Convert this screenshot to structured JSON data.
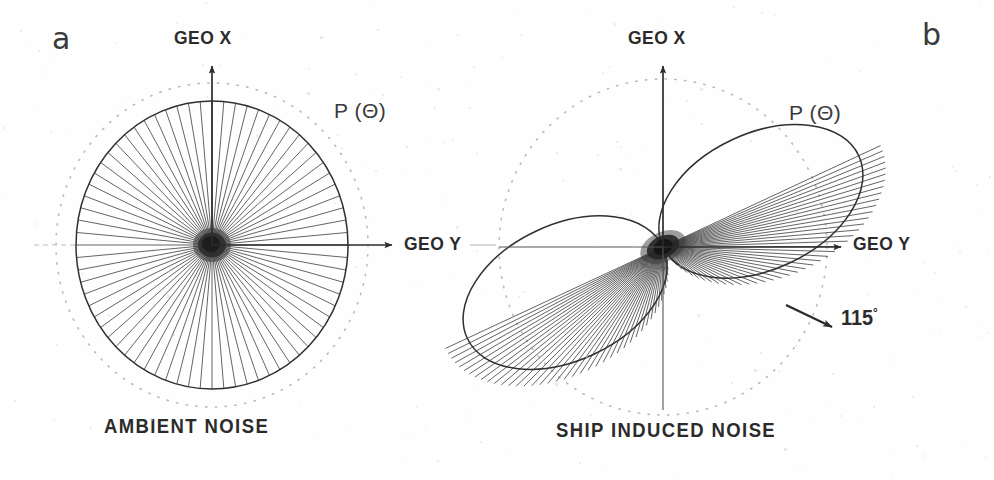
{
  "figure": {
    "background_color": "#fefefe",
    "ink_color": "#2b2b2b",
    "width": 994,
    "height": 480
  },
  "panels": [
    {
      "letter": "a",
      "caption": "AMBIENT NOISE",
      "curve_label": "P (Θ)",
      "axis_x_label": "GEO X",
      "axis_y_label": "GEO Y",
      "center": [
        212,
        245
      ],
      "letter_pos": [
        52,
        24
      ],
      "caption_pos": [
        104,
        415
      ],
      "curve_label_pos": [
        334,
        100
      ],
      "axis_x_label_pos": [
        174,
        28
      ],
      "axis_y_label_pos": [
        404,
        234
      ]
    },
    {
      "letter": "b",
      "caption": "SHIP INDUCED NOISE",
      "curve_label": "P (Θ)",
      "axis_x_label": "GEO X",
      "axis_y_label": "GEO Y",
      "angle_label": "115",
      "angle_unit": "°",
      "angle_label_pos": [
        841,
        318
      ],
      "center": [
        663,
        247
      ],
      "letter_pos": [
        922,
        20
      ],
      "caption_pos": [
        556,
        419
      ],
      "curve_label_pos": [
        789,
        102
      ],
      "axis_x_label_pos": [
        628,
        28
      ],
      "axis_y_label_pos": [
        853,
        234
      ]
    }
  ],
  "chart_data": {
    "type": "line",
    "subtitle": "Beam response P(Θ) in geographic coordinates",
    "plots": [
      {
        "name": "AMBIENT NOISE",
        "panel": "a",
        "pattern": "omnidirectional",
        "angular_label": "P (Θ)",
        "axes": [
          "GEO X",
          "GEO Y"
        ],
        "radius_major_px": 144,
        "radius_minor_px": 136,
        "spoke_count": 72,
        "reference_circle_radius_px": 158,
        "reference_circle_style": "dotted",
        "theta_deg": [
          0,
          15,
          30,
          45,
          60,
          75,
          90,
          105,
          120,
          135,
          150,
          165,
          180,
          195,
          210,
          225,
          240,
          255,
          270,
          285,
          300,
          315,
          330,
          345
        ],
        "radius_normalized": [
          1.0,
          0.99,
          0.98,
          0.97,
          0.96,
          0.95,
          0.95,
          0.95,
          0.96,
          0.97,
          0.98,
          0.99,
          1.0,
          0.99,
          0.98,
          0.97,
          0.96,
          0.95,
          0.95,
          0.95,
          0.96,
          0.97,
          0.98,
          0.99
        ],
        "notes": "Nearly isotropic response; slight elongation along GEO X"
      },
      {
        "name": "SHIP INDUCED NOISE",
        "panel": "b",
        "pattern": "dipole",
        "angular_label": "P (Θ)",
        "axes": [
          "GEO X",
          "GEO Y"
        ],
        "main_lobe_axis_deg": 115,
        "annotation": "115°",
        "lobe_length_px": 120,
        "lobe_width_px": 80,
        "spoke_count": 44,
        "reference_circle_radius_px": 166,
        "reference_circle_style": "dotted",
        "theta_deg": [
          0,
          15,
          30,
          45,
          60,
          75,
          90,
          105,
          115,
          120,
          135,
          150,
          165,
          180,
          195,
          210,
          225,
          240,
          255,
          270,
          285,
          295,
          300,
          315,
          330,
          345
        ],
        "radius_normalized": [
          0.12,
          0.22,
          0.42,
          0.65,
          0.84,
          0.96,
          1.0,
          0.99,
          1.0,
          0.98,
          0.86,
          0.66,
          0.42,
          0.18,
          0.22,
          0.42,
          0.65,
          0.84,
          0.96,
          1.0,
          0.99,
          1.0,
          0.98,
          0.86,
          0.66,
          0.36
        ],
        "notes": "Two opposing lobes along the 115 degree bearing axis"
      }
    ],
    "xlabel": "GEO Y",
    "ylabel": "GEO X",
    "grid": false,
    "legend": "none"
  }
}
